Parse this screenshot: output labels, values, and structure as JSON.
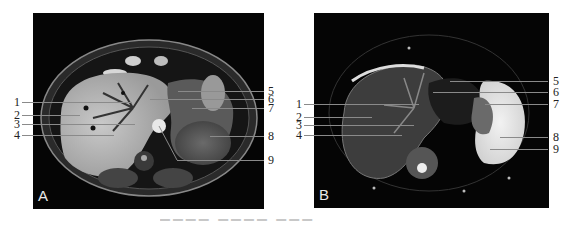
{
  "figure": {
    "panels": [
      {
        "id": "A",
        "letter": "A",
        "modality": "T1-weighted axial MRI (upper abdomen)",
        "labels_left": [
          "1",
          "2",
          "3",
          "4"
        ],
        "labels_right": [
          "5",
          "6",
          "7",
          "8",
          "9"
        ]
      },
      {
        "id": "B",
        "letter": "B",
        "modality": "T2-weighted fat-suppressed axial MRI (upper abdomen)",
        "labels_left": [
          "1",
          "2",
          "3",
          "4"
        ],
        "labels_right": [
          "5",
          "6",
          "7",
          "8",
          "9"
        ]
      }
    ],
    "caption_visible": "(cut off at bottom edge)"
  },
  "colors": {
    "background": "#ffffff",
    "panel": "#050505",
    "leader_line": "#8a8a8a",
    "label_text": "#222222"
  }
}
